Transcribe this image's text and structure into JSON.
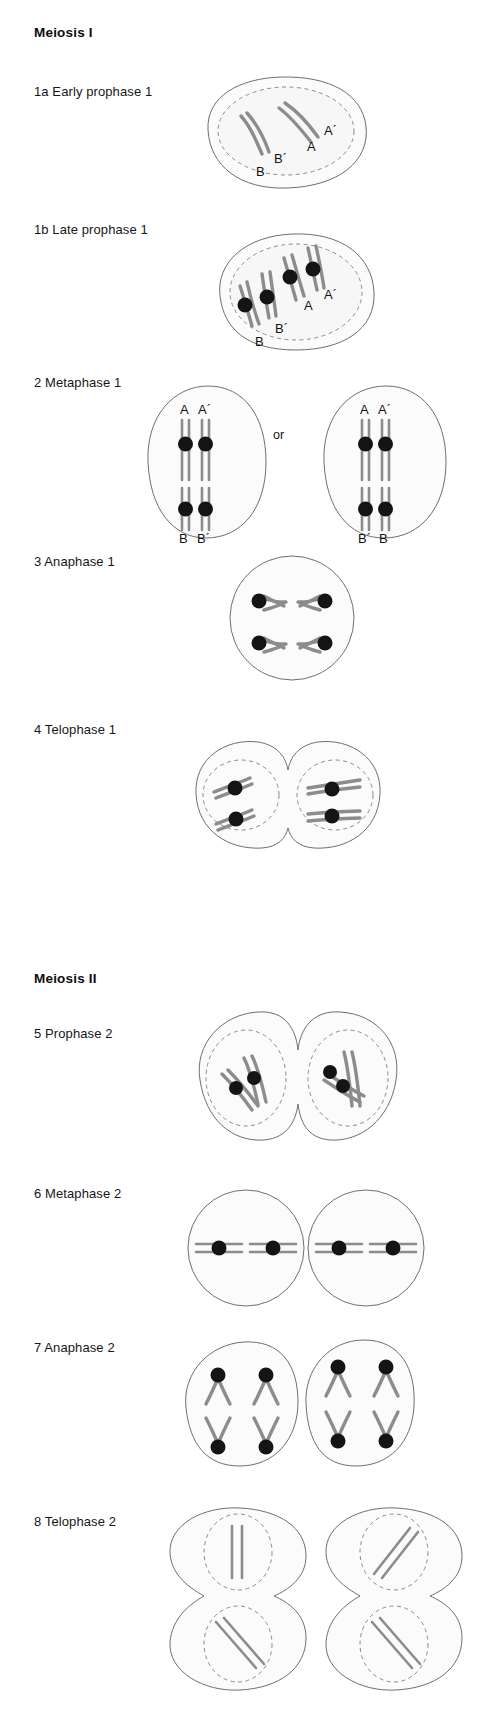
{
  "figure": {
    "title_meiosis_1": "Meiosis I",
    "title_meiosis_2": "Meiosis II",
    "or_connector": "or"
  },
  "stages": [
    {
      "id": "1a",
      "label": "1a  Early prophase 1",
      "number": "1a",
      "name": "Early prophase 1",
      "cells": 1
    },
    {
      "id": "1b",
      "label": "1b  Late prophase 1",
      "number": "1b",
      "name": "Late prophase 1",
      "cells": 1
    },
    {
      "id": "2",
      "label": "2  Metaphase 1",
      "number": "2",
      "name": "Metaphase 1",
      "cells": 2
    },
    {
      "id": "3",
      "label": "3  Anaphase 1",
      "number": "3",
      "name": "Anaphase 1",
      "cells": 1
    },
    {
      "id": "4",
      "label": "4  Telophase 1",
      "number": "4",
      "name": "Telophase 1",
      "cells": 2
    },
    {
      "id": "5",
      "label": "5  Prophase 2",
      "number": "5",
      "name": "Prophase 2",
      "cells": 2
    },
    {
      "id": "6",
      "label": "6  Metaphase 2",
      "number": "6",
      "name": "Metaphase 2",
      "cells": 2
    },
    {
      "id": "7",
      "label": "7  Anaphase 2",
      "number": "7",
      "name": "Anaphase 2",
      "cells": 2
    },
    {
      "id": "8",
      "label": "8  Telophase 2",
      "number": "8",
      "name": "Telophase 2",
      "cells": 4
    }
  ],
  "chromosome_labels": {
    "A": "A",
    "A_prime": "A´",
    "B": "B",
    "B_prime": "B´"
  },
  "stage_1a_labels": [
    "A´",
    "A",
    "B´",
    "B"
  ],
  "stage_1b_labels": [
    "A´",
    "A",
    "B´",
    "B"
  ],
  "stage_2_left_labels": {
    "top": [
      "A",
      "A´"
    ],
    "bottom": [
      "B",
      "B´"
    ]
  },
  "stage_2_right_labels": {
    "top": [
      "A",
      "A´"
    ],
    "bottom": [
      "B´",
      "B"
    ]
  },
  "colors": {
    "chromosome": "#8c8c8c",
    "centromere": "#141414",
    "membrane": "#6f6f6f",
    "nuclear_envelope": "#8a8a8a",
    "cytoplasm": "#fbfbfb",
    "text": "#121212",
    "background": "#ffffff"
  }
}
